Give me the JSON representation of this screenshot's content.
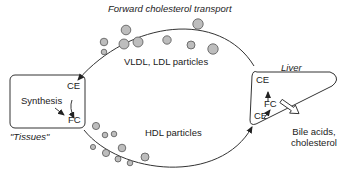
{
  "title": "Forward cholesterol transport",
  "tissues": {
    "label": "\"Tissues\"",
    "ce": "CE",
    "fc": "FC",
    "synthesis": "Synthesis"
  },
  "liver": {
    "label": "Liver",
    "ce_top": "CE",
    "fc": "FC",
    "ce_bottom": "CE",
    "output_line1": "Bile acids,",
    "output_line2": "cholesterol"
  },
  "flows": {
    "top": "VLDL, LDL particles",
    "bottom": "HDL particles"
  },
  "colors": {
    "particle_fill": "#bdbdbd",
    "particle_stroke": "#555555",
    "line": "#333333"
  }
}
